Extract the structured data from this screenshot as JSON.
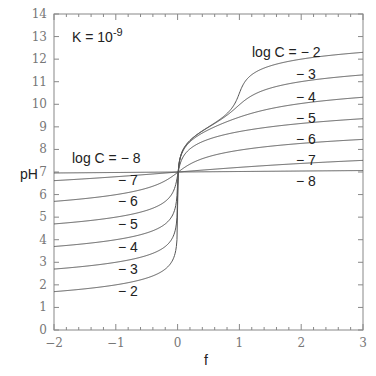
{
  "chart_data": {
    "type": "line",
    "title": "",
    "annotation": "K = 10^-9",
    "annotation_base": "K = 10",
    "annotation_exp": "-9",
    "xlabel": "f",
    "ylabel": "pH",
    "xlim": [
      -2,
      3
    ],
    "ylim": [
      0,
      14
    ],
    "xticks": [
      "-2",
      "-1",
      "0",
      "1",
      "2",
      "3"
    ],
    "yticks": [
      "0",
      "1",
      "2",
      "3",
      "4",
      "5",
      "6",
      "7",
      "8",
      "9",
      "10",
      "11",
      "12",
      "13",
      "14"
    ],
    "grid": false,
    "legend": "inline labels",
    "model": {
      "Ka": 1e-09,
      "Kw": 1e-14
    },
    "series": [
      {
        "name": "log C = -2",
        "logC": -2,
        "label": "log C = − 2",
        "ph_at_f_-2": 1.7,
        "ph_at_f_0": 7.0,
        "ph_at_f_3": 12.3
      },
      {
        "name": "log C = -3",
        "logC": -3,
        "label": "− 3",
        "ph_at_f_-2": 2.7,
        "ph_at_f_0": 7.0,
        "ph_at_f_3": 11.3
      },
      {
        "name": "log C = -4",
        "logC": -4,
        "label": "− 4",
        "ph_at_f_-2": 3.7,
        "ph_at_f_0": 7.0,
        "ph_at_f_3": 10.3
      },
      {
        "name": "log C = -5",
        "logC": -5,
        "label": "− 5",
        "ph_at_f_-2": 4.7,
        "ph_at_f_0": 7.0,
        "ph_at_f_3": 9.3
      },
      {
        "name": "log C = -6",
        "logC": -6,
        "label": "− 6",
        "ph_at_f_-2": 5.7,
        "ph_at_f_0": 7.0,
        "ph_at_f_3": 8.3
      },
      {
        "name": "log C = -7",
        "logC": -7,
        "label": "− 7",
        "ph_at_f_-2": 6.6,
        "ph_at_f_0": 7.0,
        "ph_at_f_3": 7.4
      },
      {
        "name": "log C = -8",
        "logC": -8,
        "label": "log C = − 8",
        "ph_at_f_-2": 6.96,
        "ph_at_f_0": 7.0,
        "ph_at_f_3": 7.05
      }
    ],
    "left_labels": [
      "log C = − 8",
      "− 7",
      "− 6",
      "− 5",
      "− 4",
      "− 3",
      "− 2"
    ],
    "right_labels": [
      "log C = − 2",
      "− 3",
      "− 4",
      "− 5",
      "− 6",
      "− 7",
      "− 8"
    ]
  }
}
